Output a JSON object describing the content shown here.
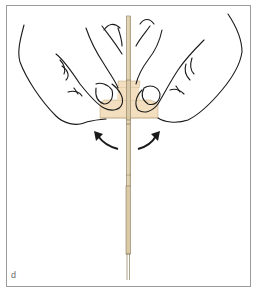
{
  "figure": {
    "panel_label": "d",
    "colors": {
      "outline": "#1a1a1a",
      "tape_fill": "#f3dfc0",
      "rod_fill": "#d9c9a6",
      "rod_edge": "#8a7a5a",
      "frame_border": "#9a9a9a",
      "label": "#6a6a6a"
    },
    "elements": {
      "left_hand": "left-hand",
      "right_hand": "right-hand",
      "tape": "tape",
      "rod": "rod",
      "arrow_left": "rotation-arrow-left",
      "arrow_right": "rotation-arrow-right"
    }
  }
}
